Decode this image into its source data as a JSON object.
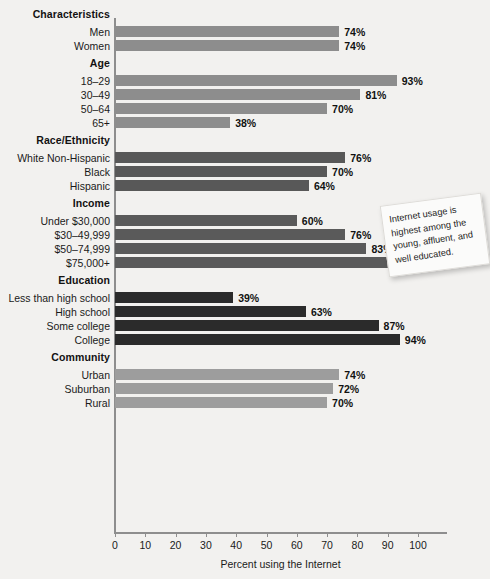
{
  "chart_data": {
    "type": "bar",
    "orientation": "horizontal",
    "title": "",
    "xlabel": "Percent using the Internet",
    "ylabel": "",
    "xlim": [
      0,
      100
    ],
    "xticks": [
      0,
      10,
      20,
      30,
      40,
      50,
      60,
      70,
      80,
      90,
      100
    ],
    "grid": false,
    "legend": "none",
    "value_suffix": "%",
    "groups": [
      {
        "name": "Characteristics",
        "color": "#8d8d8d",
        "items": [
          {
            "label": "Men",
            "value": 74,
            "value_label": "74%"
          },
          {
            "label": "Women",
            "value": 74,
            "value_label": "74%"
          }
        ]
      },
      {
        "name": "Age",
        "color": "#8d8d8d",
        "items": [
          {
            "label": "18–29",
            "value": 93,
            "value_label": "93%"
          },
          {
            "label": "30–49",
            "value": 81,
            "value_label": "81%"
          },
          {
            "label": "50–64",
            "value": 70,
            "value_label": "70%"
          },
          {
            "label": "65+",
            "value": 38,
            "value_label": "38%"
          }
        ]
      },
      {
        "name": "Race/Ethnicity",
        "color": "#585858",
        "items": [
          {
            "label": "White Non-Hispanic",
            "value": 76,
            "value_label": "76%"
          },
          {
            "label": "Black",
            "value": 70,
            "value_label": "70%"
          },
          {
            "label": "Hispanic",
            "value": 64,
            "value_label": "64%"
          }
        ]
      },
      {
        "name": "Income",
        "color": "#5a5a5a",
        "items": [
          {
            "label": "Under $30,000",
            "value": 60,
            "value_label": "60%"
          },
          {
            "label": "$30–49,999",
            "value": 76,
            "value_label": "76%"
          },
          {
            "label": "$50–74,999",
            "value": 83,
            "value_label": "83%"
          },
          {
            "label": "$75,000+",
            "value": 94,
            "value_label": "94%"
          }
        ]
      },
      {
        "name": "Education",
        "color": "#2b2b2b",
        "items": [
          {
            "label": "Less than high school",
            "value": 39,
            "value_label": "39%"
          },
          {
            "label": "High school",
            "value": 63,
            "value_label": "63%"
          },
          {
            "label": "Some college",
            "value": 87,
            "value_label": "87%"
          },
          {
            "label": "College",
            "value": 94,
            "value_label": "94%"
          }
        ]
      },
      {
        "name": "Community",
        "color": "#9d9d9d",
        "items": [
          {
            "label": "Urban",
            "value": 74,
            "value_label": "74%"
          },
          {
            "label": "Suburban",
            "value": 72,
            "value_label": "72%"
          },
          {
            "label": "Rural",
            "value": 70,
            "value_label": "70%"
          }
        ]
      }
    ],
    "annotations": [
      {
        "text": "Internet usage is highest among the young, affluent, and well educated."
      }
    ]
  }
}
